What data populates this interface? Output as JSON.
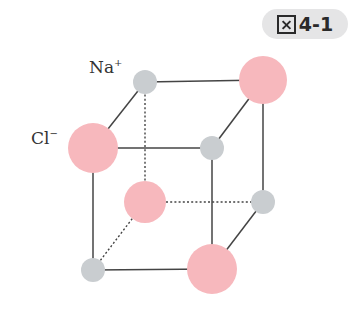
{
  "figure": {
    "badge_prefix": "図",
    "badge_number": "4-1"
  },
  "labels": {
    "sodium": {
      "symbol": "Na",
      "charge": "+"
    },
    "chloride": {
      "symbol": "Cl",
      "charge": "−"
    }
  },
  "colors": {
    "na_ion": "#c9cdd0",
    "cl_ion": "#f7b8bd",
    "edge": "#444444",
    "badge_bg": "#e5e5e6"
  },
  "lattice": {
    "atoms": [
      {
        "id": "na-back-top-left",
        "ion": "Na+",
        "cx": 145,
        "cy": 82,
        "r": 12
      },
      {
        "id": "cl-back-top-right",
        "ion": "Cl-",
        "cx": 263,
        "cy": 80,
        "r": 24
      },
      {
        "id": "cl-front-top-left",
        "ion": "Cl-",
        "cx": 93,
        "cy": 148,
        "r": 25
      },
      {
        "id": "na-front-top-right",
        "ion": "Na+",
        "cx": 212,
        "cy": 148,
        "r": 12
      },
      {
        "id": "cl-back-bottom-left",
        "ion": "Cl-",
        "cx": 145,
        "cy": 202,
        "r": 21
      },
      {
        "id": "na-back-bottom-right",
        "ion": "Na+",
        "cx": 263,
        "cy": 202,
        "r": 12
      },
      {
        "id": "na-front-bottom-left",
        "ion": "Na+",
        "cx": 93,
        "cy": 270,
        "r": 12
      },
      {
        "id": "cl-front-bottom-right",
        "ion": "Cl-",
        "cx": 212,
        "cy": 269,
        "r": 25
      }
    ]
  }
}
